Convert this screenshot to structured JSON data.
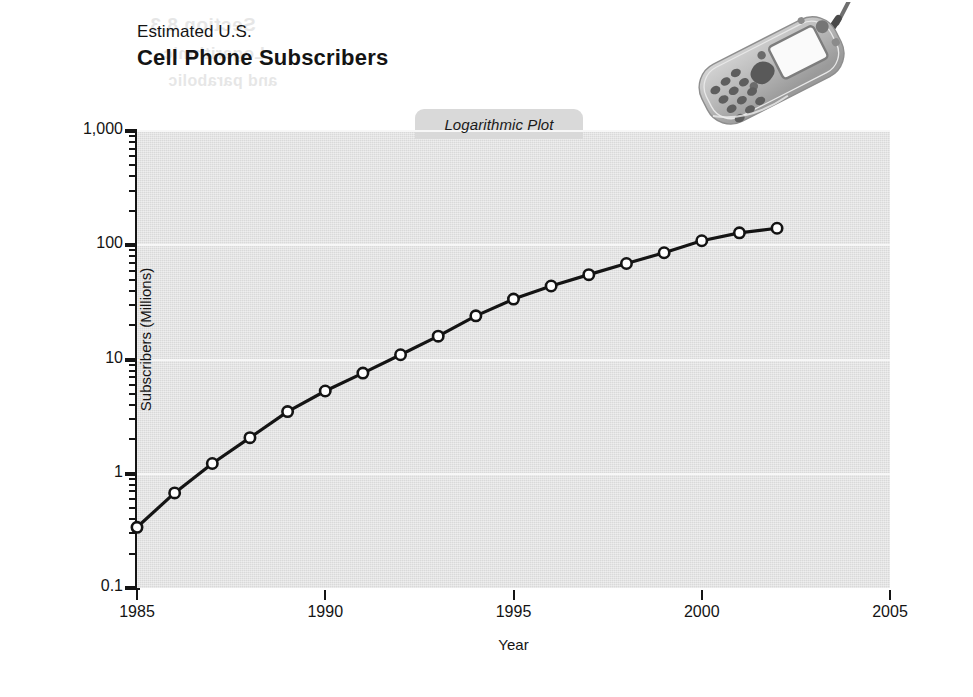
{
  "figure": {
    "title_small": "Estimated U.S.",
    "title_main": "Cell Phone Subscribers",
    "plot_tab_label": "Logarithmic Plot",
    "photo_caption": "cell-phone-photo",
    "ghost_text": {
      "line1": "Section 8.3",
      "line2": "Logarithmic",
      "line3": "and parabolic",
      "line4": "the function",
      "line5": "Figure 8.21"
    }
  },
  "chart_data": {
    "type": "line",
    "title": "Estimated U.S. Cell Phone Subscribers",
    "subtitle": "Logarithmic Plot",
    "xlabel": "Year",
    "ylabel": "Subscribers (Millions)",
    "yscale": "log",
    "xlim": [
      1985,
      2005
    ],
    "ylim": [
      0.1,
      1000
    ],
    "grid": true,
    "legend": "none",
    "x_ticks": [
      "1985",
      "1990",
      "1995",
      "2000",
      "2005"
    ],
    "x_tick_values": [
      1985,
      1990,
      1995,
      2000,
      2005
    ],
    "y_ticks": [
      "0.1",
      "1",
      "10",
      "100",
      "1,000"
    ],
    "y_tick_values": [
      0.1,
      1,
      10,
      100,
      1000
    ],
    "y_minor_ticks": [
      2,
      3,
      4,
      5,
      6,
      7,
      8,
      9
    ],
    "marker": "open-circle",
    "line_color": "#141414",
    "marker_fill": "#ffffff",
    "plot_background": "#d9d9d9",
    "gridline_color": "#f7f7f7",
    "x": [
      1985,
      1986,
      1987,
      1988,
      1989,
      1990,
      1991,
      1992,
      1993,
      1994,
      1995,
      1996,
      1997,
      1998,
      1999,
      2000,
      2001,
      2002
    ],
    "values": [
      0.34,
      0.68,
      1.23,
      2.07,
      3.5,
      5.3,
      7.6,
      11.0,
      16.0,
      24.1,
      33.8,
      44.0,
      55.3,
      69.2,
      86.0,
      109.5,
      128.4,
      140.8
    ]
  }
}
